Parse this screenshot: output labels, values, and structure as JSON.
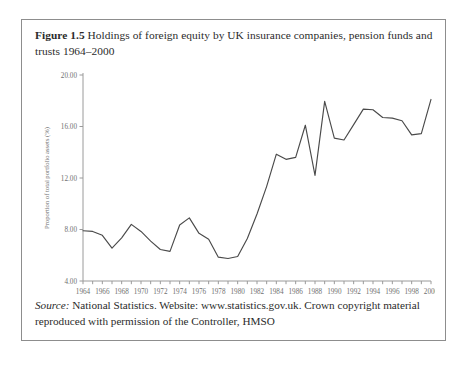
{
  "figure": {
    "label": "Figure 1.5",
    "title": "Holdings of foreign equity by UK insurance companies, pension funds and trusts 1964–2000"
  },
  "source": {
    "word": "Source:",
    "text": " National Statistics. Website: www.statistics.gov.uk. Crown copyright material reproduced with permission of the Controller, HMSO"
  },
  "colors": {
    "frame": "#8d8d8d",
    "axis": "#9a9a9a",
    "line": "#4a4a4a",
    "text": "#2b2b2b",
    "tick_text": "#707070",
    "background": "#ffffff"
  },
  "chart_data": {
    "type": "line",
    "title": "Holdings of foreign equity by UK insurance companies, pension funds and trusts 1964–2000",
    "xlabel": "",
    "ylabel": "Proportion of total portfolio assets (%)",
    "ylim": [
      4.0,
      20.0
    ],
    "xlim": [
      1964,
      2000
    ],
    "grid": false,
    "legend": "none",
    "ytick_labels": [
      "4.00",
      "8.00",
      "12.00",
      "16.00",
      "20.00"
    ],
    "ytick_values": [
      4.0,
      8.0,
      12.0,
      16.0,
      20.0
    ],
    "xtick_labels": [
      "1964",
      "1966",
      "1968",
      "1970",
      "1972",
      "1974",
      "1976",
      "1978",
      "1980",
      "1982",
      "1984",
      "1986",
      "1988",
      "1990",
      "1992",
      "1994",
      "1996",
      "1998",
      "2000"
    ],
    "xtick_values": [
      1964,
      1966,
      1968,
      1970,
      1972,
      1974,
      1976,
      1978,
      1980,
      1982,
      1984,
      1986,
      1988,
      1990,
      1992,
      1994,
      1996,
      1998,
      2000
    ],
    "x": [
      1964,
      1965,
      1966,
      1967,
      1968,
      1969,
      1970,
      1971,
      1972,
      1973,
      1974,
      1975,
      1976,
      1977,
      1978,
      1979,
      1980,
      1981,
      1982,
      1983,
      1984,
      1985,
      1986,
      1987,
      1988,
      1989,
      1990,
      1991,
      1992,
      1993,
      1994,
      1995,
      1996,
      1997,
      1998,
      1999,
      2000
    ],
    "y": [
      7.9,
      7.85,
      7.55,
      6.55,
      7.35,
      8.4,
      7.85,
      7.1,
      6.45,
      6.3,
      8.35,
      8.9,
      7.7,
      7.25,
      5.85,
      5.75,
      5.9,
      7.3,
      9.2,
      11.35,
      13.85,
      13.45,
      13.6,
      16.1,
      12.2,
      17.95,
      15.1,
      14.95,
      16.15,
      17.35,
      17.3,
      16.7,
      16.65,
      16.45,
      15.35,
      15.45,
      18.1
    ],
    "series": [
      {
        "name": "Foreign equity holdings",
        "values": [
          7.9,
          7.85,
          7.55,
          6.55,
          7.35,
          8.4,
          7.85,
          7.1,
          6.45,
          6.3,
          8.35,
          8.9,
          7.7,
          7.25,
          5.85,
          5.75,
          5.9,
          7.3,
          9.2,
          11.35,
          13.85,
          13.45,
          13.6,
          16.1,
          12.2,
          17.95,
          15.1,
          14.95,
          16.15,
          17.35,
          17.3,
          16.7,
          16.65,
          16.45,
          15.35,
          15.45,
          18.1
        ]
      }
    ]
  }
}
